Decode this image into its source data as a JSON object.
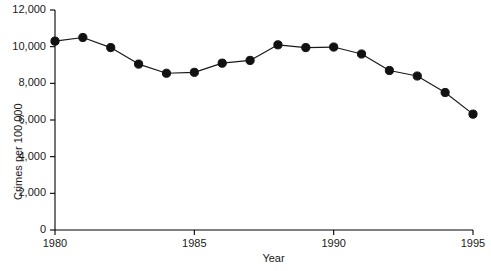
{
  "chart_data": {
    "type": "line",
    "title": "",
    "xlabel": "Year",
    "ylabel": "Crimes per 100,000",
    "xlim": [
      1980,
      1995
    ],
    "ylim": [
      0,
      12000
    ],
    "grid": false,
    "legend": "none",
    "marker": "filled-circle",
    "xticks": [
      1980,
      1985,
      1990,
      1995
    ],
    "xtick_labels": [
      "1980",
      "1985",
      "1990",
      "1995"
    ],
    "yticks": [
      0,
      2000,
      4000,
      6000,
      8000,
      10000,
      12000
    ],
    "ytick_labels": [
      "0",
      "2,000",
      "4,000",
      "6,000",
      "8,000",
      "10,000",
      "12,000"
    ],
    "x": [
      1980,
      1981,
      1982,
      1983,
      1984,
      1985,
      1986,
      1987,
      1988,
      1989,
      1990,
      1991,
      1992,
      1993,
      1994,
      1995
    ],
    "values": [
      10300,
      10500,
      9950,
      9050,
      8550,
      8600,
      9100,
      9250,
      10100,
      9950,
      9980,
      9600,
      8700,
      8400,
      7500,
      6320
    ]
  }
}
